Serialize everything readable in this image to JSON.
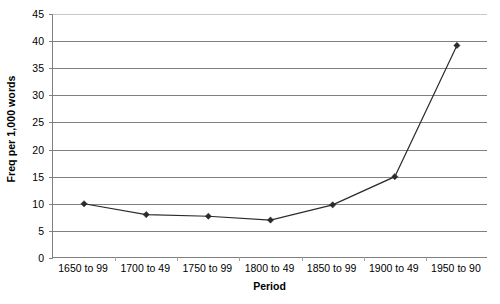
{
  "chart_data": {
    "type": "line",
    "title": "",
    "xlabel": "Period",
    "ylabel": "Freq per 1,000 words",
    "categories": [
      "1650 to 99",
      "1700 to 49",
      "1750 to 99",
      "1800 to 49",
      "1850 to 99",
      "1900 to 49",
      "1950 to 90"
    ],
    "values": [
      10,
      8,
      7.7,
      7,
      9.8,
      15,
      39.2
    ],
    "ylim": [
      0,
      45
    ],
    "ytick_step": 5,
    "yticks": [
      "0",
      "5",
      "10",
      "15",
      "20",
      "25",
      "30",
      "35",
      "40",
      "45"
    ],
    "ytick_values": [
      0,
      5,
      10,
      15,
      20,
      25,
      30,
      35,
      40,
      45
    ],
    "grid": true,
    "grid_axis": "y",
    "legend": "none",
    "marker": "diamond",
    "series_color": "#2b2b2b",
    "grid_color": "#808080",
    "axis_color": "#808080",
    "background": "#ffffff"
  }
}
